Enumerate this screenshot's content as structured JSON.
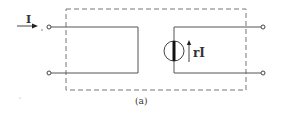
{
  "diagram": {
    "caption": "(a)",
    "input_current_label": "I",
    "source_label": "rI",
    "source_type": "current-controlled-current-source",
    "colors": {
      "line": "#555555",
      "dashed_box": "#777777",
      "text": "#333333",
      "background": "#ffffff"
    }
  }
}
